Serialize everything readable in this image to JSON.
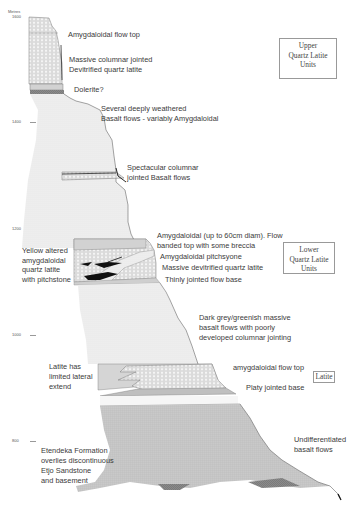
{
  "axis": {
    "title": "Metres",
    "ticks": [
      {
        "label": "1600",
        "y": 17
      },
      {
        "label": "1400",
        "y": 122
      },
      {
        "label": "1200",
        "y": 229
      },
      {
        "label": "1000",
        "y": 335
      },
      {
        "label": "800",
        "y": 441
      }
    ]
  },
  "unit_boxes": {
    "upper": [
      "Upper",
      "Quartz Latite",
      "Units"
    ],
    "lower": [
      "Lower",
      "Quartz Latite",
      "Units"
    ],
    "latite": [
      "Latite"
    ]
  },
  "annotations": {
    "amygdaloidal_flow_top_upper": [
      "Amygdaloidal flow top"
    ],
    "massive_columnar": [
      "Massive columnar jointed",
      "Devitrified quartz latite"
    ],
    "dolerite": [
      "Dolerite?"
    ],
    "weathered_basalt": [
      "Several deeply weathered",
      "Basalt flows - variably Amygdaloidal"
    ],
    "columnar_basalt": [
      "Spectacular columnar",
      "jointed Basalt flows"
    ],
    "amygdaloidal_60cm": [
      "Amygdaloidal (up to 60cm diam). Flow",
      "banded top with some breccia"
    ],
    "pitchstone": [
      "Amygdaloidal pitchsyone"
    ],
    "massive_devitrified": [
      "Massive devitrified quartz latite"
    ],
    "thinly_jointed": [
      "Thinly jointed flow base"
    ],
    "yellow_altered": [
      "Yellow altered",
      "amygdaloidal",
      "quartz latite",
      "with pitchstone"
    ],
    "dark_grey_basalt": [
      "Dark grey/greenish massive",
      "basalt flows with poorly",
      "developed columnar jointing"
    ],
    "latite_limited": [
      "Latite has",
      "limited lateral",
      "extend"
    ],
    "amygdaloidal_flow_top_lower": [
      "amygdaloidal flow top"
    ],
    "platy_jointed": [
      "Platy jointed base"
    ],
    "undifferentiated": [
      "Undifferentiated",
      "basalt flows"
    ],
    "etendeka": [
      "Etendeka Formation",
      "overlies discontinuous",
      "Etjo Sandstone",
      "and basement"
    ]
  },
  "colors": {
    "basalt_light": "#efefef",
    "basalt_mid": "#d9d9d9",
    "basalt_dark": "#b8b8b8",
    "latite_hatch": "#cfcfcf",
    "outline": "#555555",
    "pitchstone": "#111111"
  }
}
